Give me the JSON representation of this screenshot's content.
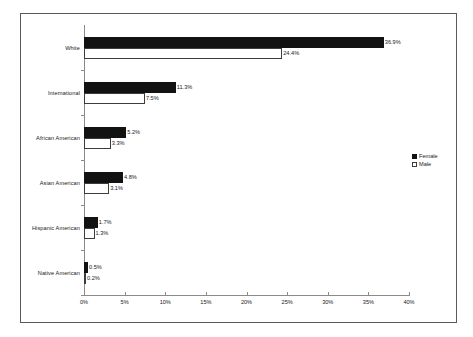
{
  "chart_data": {
    "type": "bar",
    "orientation": "horizontal",
    "title": "",
    "subtitle": "",
    "xlabel": "",
    "ylabel": "",
    "xlim": [
      0,
      40
    ],
    "x_tick_labels": [
      "0%",
      "5%",
      "10%",
      "15%",
      "20%",
      "25%",
      "30%",
      "35%",
      "40%"
    ],
    "x_tick_values": [
      0,
      5,
      10,
      15,
      20,
      25,
      30,
      35,
      40
    ],
    "grid": false,
    "legend_position": "right",
    "categories": [
      "White",
      "International",
      "African American",
      "Asian American",
      "Hispanic American",
      "Native American"
    ],
    "series": [
      {
        "name": "Female",
        "color": "#121212",
        "values": [
          36.9,
          11.3,
          5.2,
          4.8,
          1.7,
          0.5
        ],
        "labels": [
          "36.9%",
          "11.3%",
          "5.2%",
          "4.8%",
          "1.7%",
          "0.5%"
        ]
      },
      {
        "name": "Male",
        "color": "#ffffff",
        "values": [
          24.4,
          7.5,
          3.3,
          3.1,
          1.3,
          0.2
        ],
        "labels": [
          "24.4%",
          "7.5%",
          "3.3%",
          "3.1%",
          "1.3%",
          "0.2%"
        ]
      }
    ]
  },
  "legend": {
    "items": [
      {
        "label": "Female",
        "swatch": "filled-square-icon"
      },
      {
        "label": "Male",
        "swatch": "open-square-icon"
      }
    ]
  }
}
